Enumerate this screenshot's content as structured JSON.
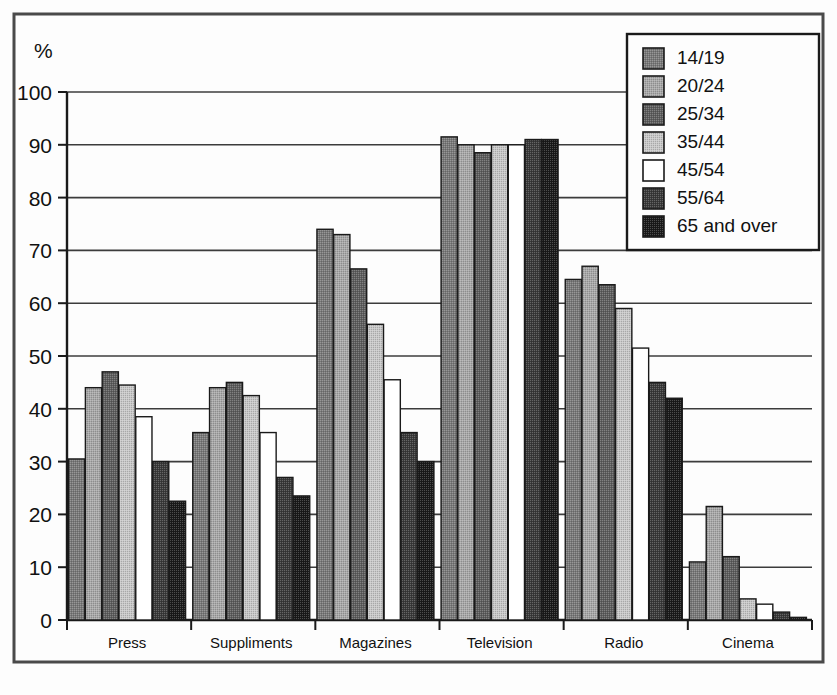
{
  "chart_data": {
    "type": "bar",
    "title": "",
    "xlabel": "",
    "ylabel": "%",
    "ylim": [
      0,
      100
    ],
    "ytick_step": 10,
    "yticks": [
      "0",
      "10",
      "20",
      "30",
      "40",
      "50",
      "60",
      "70",
      "80",
      "90",
      "100"
    ],
    "grid": true,
    "legend_position": "top-right",
    "categories": [
      "Press",
      "Suppliments",
      "Magazines",
      "Television",
      "Radio",
      "Cinema"
    ],
    "series": [
      {
        "name": "14/19",
        "swatch": "#7a7a7a",
        "values": [
          30.5,
          35.5,
          74.0,
          91.5,
          64.5,
          11.0
        ]
      },
      {
        "name": "20/24",
        "swatch": "#a8a8a8",
        "values": [
          44.0,
          44.0,
          73.0,
          90.0,
          67.0,
          21.5
        ]
      },
      {
        "name": "25/34",
        "swatch": "#5e5e5e",
        "values": [
          47.0,
          45.0,
          66.5,
          88.5,
          63.5,
          12.0
        ]
      },
      {
        "name": "35/44",
        "swatch": "#c8c8c8",
        "values": [
          44.5,
          42.5,
          56.0,
          90.0,
          59.0,
          4.0
        ]
      },
      {
        "name": "45/54",
        "swatch": "#ffffff",
        "values": [
          38.5,
          35.5,
          45.5,
          90.0,
          51.5,
          3.0
        ]
      },
      {
        "name": "55/64",
        "swatch": "#3a3a3a",
        "values": [
          30.0,
          27.0,
          35.5,
          91.0,
          45.0,
          1.5
        ]
      },
      {
        "name": "65 and over",
        "swatch": "#1a1a1a",
        "values": [
          22.5,
          23.5,
          30.0,
          91.0,
          42.0,
          0.5
        ]
      }
    ]
  },
  "colors": {
    "frame": "#4a4a4a",
    "axis": "#1a1a1a",
    "grid": "#3c3c3c",
    "bar_outline": "#1a1a1a",
    "background": "#fdfdfd",
    "legend_border": "#1a1a1a"
  }
}
